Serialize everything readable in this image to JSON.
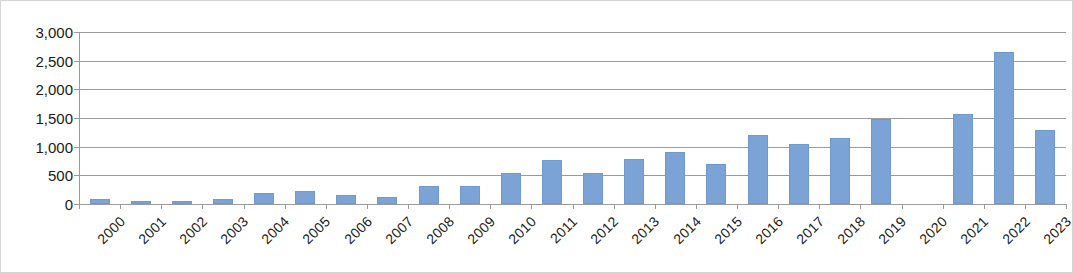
{
  "chart_data": {
    "type": "bar",
    "title": "",
    "subtitle": "",
    "xlabel": "",
    "ylabel": "",
    "ylim": [
      0,
      3000
    ],
    "ytick_labels": [
      "3,000",
      "2,500",
      "2,000",
      "1,500",
      "1,000",
      "500",
      "0"
    ],
    "yticks": [
      3000,
      2500,
      2000,
      1500,
      1000,
      500,
      0
    ],
    "grid": true,
    "legend": "none",
    "series_color": "#7ba3d6",
    "categories": [
      "2000",
      "2001",
      "2002",
      "2003",
      "2004",
      "2005",
      "2006",
      "2007",
      "2008",
      "2009",
      "2010",
      "2011",
      "2012",
      "2013",
      "2014",
      "2015",
      "2016",
      "2017",
      "2018",
      "2019",
      "2020",
      "2021",
      "2022",
      "2023"
    ],
    "values": [
      90,
      50,
      45,
      85,
      195,
      220,
      160,
      130,
      320,
      320,
      540,
      760,
      540,
      790,
      910,
      700,
      1200,
      1040,
      1150,
      1490,
      0,
      1570,
      2660,
      1290
    ],
    "series": [
      {
        "name": "",
        "values": [
          90,
          50,
          45,
          85,
          195,
          220,
          160,
          130,
          320,
          320,
          540,
          760,
          540,
          790,
          910,
          700,
          1200,
          1040,
          1150,
          1490,
          0,
          1570,
          2660,
          1290
        ]
      }
    ]
  },
  "style": {
    "border_color": "#d4d4d4",
    "gridline_color": "#9a9a9a",
    "bar_fill": "#7ba3d6",
    "bar_stroke": "#6f9ad1",
    "text_color": "#1a1a1a",
    "background": "#ffffff"
  }
}
